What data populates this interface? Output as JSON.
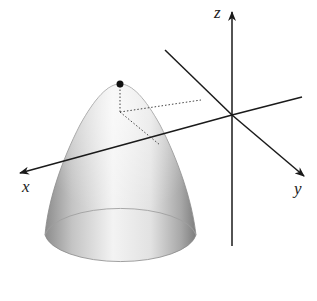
{
  "figure": {
    "axes": {
      "x_label": "x",
      "y_label": "y",
      "z_label": "z"
    },
    "vertex_marker": "vertex-point",
    "colors": {
      "axis": "#1a1a1a",
      "surface_light": "#f4f4f4",
      "surface_dark": "#9a9a9a",
      "dotted": "#444444"
    }
  }
}
